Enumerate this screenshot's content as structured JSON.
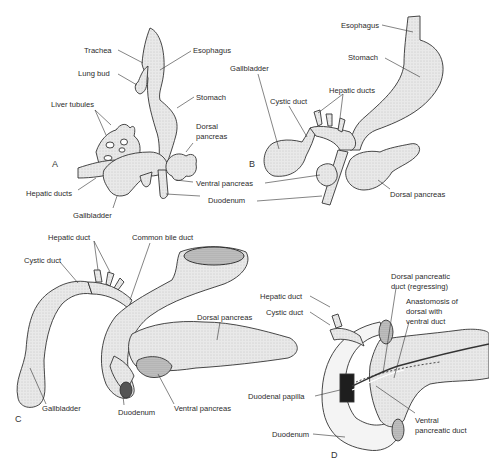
{
  "figure": {
    "panels": [
      {
        "id": "A",
        "letter": "A",
        "labels": {
          "trachea": "Trachea",
          "esophagus": "Esophagus",
          "lung_bud": "Lung bud",
          "stomach": "Stomach",
          "liver_tubules": "Liver tubules",
          "dorsal_pancreas_1": "Dorsal",
          "dorsal_pancreas_2": "pancreas",
          "hepatic_ducts": "Hepatic ducts",
          "ventral_pancreas": "Ventral pancreas",
          "gallbladder": "Gallbladder",
          "duodenum": "Duodenum"
        }
      },
      {
        "id": "B",
        "letter": "B",
        "labels": {
          "esophagus": "Esophagus",
          "stomach": "Stomach",
          "gallbladder": "Gallbladder",
          "hepatic_ducts": "Hepatic ducts",
          "cystic_duct": "Cystic duct",
          "dorsal_pancreas": "Dorsal pancreas"
        }
      },
      {
        "id": "C",
        "letter": "C",
        "labels": {
          "hepatic_duct": "Hepatic duct",
          "common_bile_duct": "Common bile duct",
          "cystic_duct": "Cystic duct",
          "dorsal_pancreas": "Dorsal pancreas",
          "gallbladder": "Gallbladder",
          "duodenum": "Duodenum",
          "ventral_pancreas": "Ventral pancreas"
        }
      },
      {
        "id": "D",
        "letter": "D",
        "labels": {
          "hepatic_duct": "Hepatic duct",
          "cystic_duct": "Cystic duct",
          "dorsal_pancreatic_duct_1": "Dorsal pancreatic",
          "dorsal_pancreatic_duct_2": "duct (regressing)",
          "anastomosis_1": "Anastomosis of",
          "anastomosis_2": "dorsal with",
          "anastomosis_3": "ventral duct",
          "duodenal_papilla": "Duodenal papilla",
          "ventral_pancreatic_duct_1": "Ventral",
          "ventral_pancreatic_duct_2": "pancreatic duct",
          "duodenum": "Duodenum"
        }
      }
    ],
    "colors": {
      "ink": "#2b2b2b",
      "tissue_fill": "#e6e6e6",
      "tissue_shade": "#9a9a9a",
      "background": "#ffffff"
    }
  }
}
